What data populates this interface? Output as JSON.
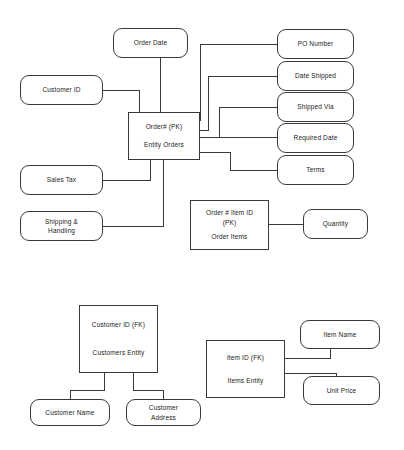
{
  "diagram": {
    "type": "entity-relationship-diagram",
    "stroke_color": "#3a3a3a",
    "text_color": "#1a1a1a",
    "background_color": "#ffffff",
    "nodes": {
      "order_date": {
        "label": "Order Date",
        "kind": "attribute"
      },
      "customer_id_attr": {
        "label": "Customer ID",
        "kind": "attribute"
      },
      "sales_tax": {
        "label": "Sales Tax",
        "kind": "attribute"
      },
      "shipping_handling": {
        "label": "Shipping &\nHandling",
        "kind": "attribute"
      },
      "po_number": {
        "label": "PO Number",
        "kind": "attribute"
      },
      "date_shipped": {
        "label": "Date Shipped",
        "kind": "attribute"
      },
      "shipped_via": {
        "label": "Shipped Via",
        "kind": "attribute"
      },
      "required_date": {
        "label": "Required Date",
        "kind": "attribute"
      },
      "terms": {
        "label": "Terms",
        "kind": "attribute"
      },
      "orders_entity": {
        "key": "Order# (PK)",
        "title": "Entity Orders",
        "kind": "entity"
      },
      "order_items_entity": {
        "key": "Order # Item ID\n(PK)",
        "title": "Order Items",
        "kind": "entity"
      },
      "quantity": {
        "label": "Quantity",
        "kind": "attribute"
      },
      "customers_entity": {
        "key": "Customer ID (FK)",
        "title": "Customers Entity",
        "kind": "entity"
      },
      "customer_name": {
        "label": "Customer Name",
        "kind": "attribute"
      },
      "customer_address": {
        "label": "Customer\nAddress",
        "kind": "attribute"
      },
      "items_entity": {
        "key": "Item ID (FK)",
        "title": "Items Entity",
        "kind": "entity"
      },
      "item_name": {
        "label": "Item Name",
        "kind": "attribute"
      },
      "unit_price": {
        "label": "Unit Price",
        "kind": "attribute"
      }
    }
  }
}
